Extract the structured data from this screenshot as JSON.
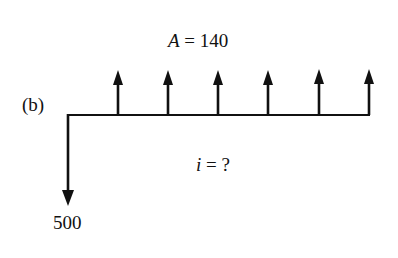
{
  "diagram": {
    "type": "cash-flow-diagram",
    "part_label": "(b)",
    "annuity": {
      "symbol": "A",
      "equals": " = ",
      "value": "140"
    },
    "rate": {
      "symbol": "i",
      "equals": " = ",
      "value": "?"
    },
    "present_value": "500",
    "periods": 6,
    "arrow_up_count": 6,
    "arrow_down_count": 1,
    "line_color": "#111111"
  }
}
